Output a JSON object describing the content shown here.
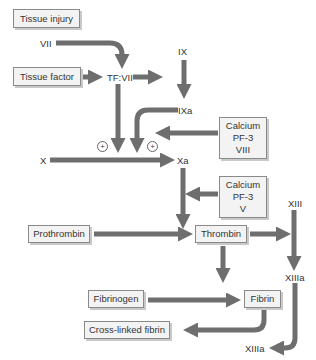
{
  "diagram": {
    "arrow_color": "#6e6e6e",
    "box_fill": "#f3f3f3",
    "boxes": {
      "tissue_injury": "Tissue injury",
      "tissue_factor": "Tissue factor",
      "cofactors_viii": [
        "Calcium",
        "PF-3",
        "VIII"
      ],
      "cofactors_v": [
        "Calcium",
        "PF-3",
        "V"
      ],
      "prothrombin": "Prothrombin",
      "thrombin": "Thrombin",
      "fibrinogen": "Fibrinogen",
      "fibrin": "Fibrin",
      "cross_linked_fibrin": "Cross-linked fibrin"
    },
    "labels": {
      "vii": "VII",
      "tf_vii": "TF:VII",
      "ix": "IX",
      "ixa": "IXa",
      "x": "X",
      "xa": "Xa",
      "xiii": "XIII",
      "xiiia_mid": "XIIIa",
      "xiiia_bottom": "XIIIa",
      "plus_left": "+",
      "plus_right": "+"
    }
  }
}
